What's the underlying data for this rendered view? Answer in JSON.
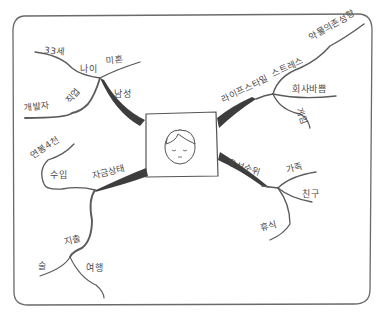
{
  "diagram": {
    "type": "mind-map",
    "style": "hand-drawn pencil sketch",
    "colors": {
      "stroke": "#5a5a5a",
      "heavy_stroke": "#3d3d3d",
      "text": "#4a4a4a",
      "background": "#ffffff"
    },
    "center": {
      "label": "",
      "icon": "person-face-portrait"
    },
    "branches": [
      {
        "id": "gender",
        "label": "남성",
        "children": [
          {
            "id": "age",
            "label": "나이",
            "children": [
              {
                "label": "33세"
              }
            ]
          },
          {
            "id": "marital",
            "label": "미혼"
          },
          {
            "id": "job",
            "label": "직업",
            "children": [
              {
                "label": "개발자"
              }
            ]
          }
        ]
      },
      {
        "id": "lifestyle",
        "label": "라이프스타일",
        "children": [
          {
            "id": "stress",
            "label": "스트레스",
            "children": [
              {
                "label": "약물의존성향"
              }
            ]
          },
          {
            "id": "busy",
            "label": "회사바쁨"
          },
          {
            "id": "game",
            "label": "게임"
          }
        ]
      },
      {
        "id": "finance",
        "label": "자금상태",
        "children": [
          {
            "id": "income",
            "label": "수입",
            "children": [
              {
                "label": "연봉4천"
              }
            ]
          },
          {
            "id": "spending",
            "label": "지출",
            "children": [
              {
                "label": "술"
              },
              {
                "label": "여행"
              }
            ]
          }
        ]
      },
      {
        "id": "priority",
        "label": "우선순위",
        "children": [
          {
            "id": "family",
            "label": "가족"
          },
          {
            "id": "friends",
            "label": "친구"
          },
          {
            "id": "rest",
            "label": "휴식"
          }
        ]
      }
    ]
  },
  "labels": {
    "gender": "남성",
    "age": "나이",
    "age_value": "33세",
    "marital": "미혼",
    "job": "직업",
    "job_value": "개발자",
    "lifestyle": "라이프스타일",
    "stress": "스트레스",
    "stress_value": "약물의존성향",
    "busy": "회사바쁨",
    "game": "게임",
    "finance": "자금상태",
    "income": "수입",
    "income_value": "연봉4천",
    "spending": "지출",
    "spending_alcohol": "술",
    "spending_travel": "여행",
    "priority": "우선순위",
    "family": "가족",
    "friends": "친구",
    "rest": "휴식"
  }
}
